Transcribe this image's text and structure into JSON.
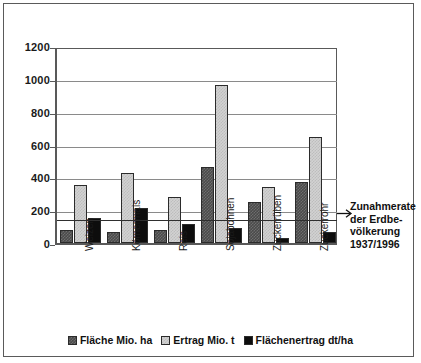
{
  "chart_data": {
    "type": "bar",
    "title": "",
    "xlabel": "",
    "ylabel": "",
    "ylim": [
      0,
      1200
    ],
    "yticks": [
      0,
      200,
      400,
      600,
      800,
      1000,
      1200
    ],
    "grid": true,
    "legend_position": "bottom",
    "categories": [
      "Weizen",
      "Körnermais",
      "Reis",
      "Sojabohnen",
      "Zuckerrüben",
      "Zuckerrohr"
    ],
    "series": [
      {
        "name": "Fläche Mio. ha",
        "values": [
          80,
          70,
          78,
          463,
          247,
          370
        ]
      },
      {
        "name": "Ertrag Mio. t",
        "values": [
          353,
          425,
          278,
          960,
          343,
          645
        ]
      },
      {
        "name": "Flächenertrag dt/ha",
        "values": [
          150,
          215,
          115,
          90,
          28,
          65
        ]
      }
    ],
    "annotations": [
      {
        "name": "population-growth-reference-line",
        "value": 150,
        "lines": [
          "Zunahmerate",
          "der Erdbe-",
          "völkerung",
          "1937/1996"
        ]
      }
    ]
  },
  "axis": {
    "tick_labels": [
      "1200",
      "1000",
      "800",
      "600",
      "400",
      "200",
      "0"
    ]
  },
  "legend": {
    "items": [
      {
        "label": "Fläche Mio. ha",
        "swatch": "checker-dark"
      },
      {
        "label": "Ertrag Mio. t",
        "swatch": "checker-light"
      },
      {
        "label": "Flächenertrag dt/ha",
        "swatch": "solid-black"
      }
    ]
  },
  "annotation": {
    "line1": "Zunahmerate",
    "line2": "der Erdbe-",
    "line3": "völkerung",
    "line4": "1937/1996",
    "arrow_icon": "arrow-left-icon"
  },
  "colors": {
    "series1": "#4a4a4a",
    "series2": "#d2d2d2",
    "series3": "#0d0d0d",
    "axis": "#595959",
    "grid": "#8a8a8a",
    "frame": "#5a5a5a",
    "text": "#111111"
  }
}
